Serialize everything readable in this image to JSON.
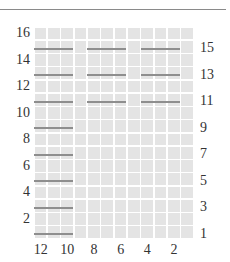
{
  "chart": {
    "title": "",
    "columns": 12,
    "rows": 16,
    "left_labels": [
      "16",
      "14",
      "12",
      "10",
      "8",
      "6",
      "4",
      "2"
    ],
    "right_labels": [
      "15",
      "13",
      "11",
      "9",
      "7",
      "5",
      "3",
      "1"
    ],
    "bottom_labels": [
      "12",
      "10",
      "8",
      "6",
      "4",
      "2"
    ],
    "colors": {
      "cell": "#e4e4e4",
      "gridline": "#ffffff",
      "stripe": "#8e8e8e",
      "label": "#333333"
    },
    "stripes": [
      {
        "row": 15,
        "segments": [
          [
            1,
            3
          ],
          [
            5,
            7
          ],
          [
            9,
            11
          ]
        ]
      },
      {
        "row": 13,
        "segments": [
          [
            1,
            3
          ],
          [
            5,
            7
          ],
          [
            9,
            11
          ]
        ]
      },
      {
        "row": 11,
        "segments": [
          [
            1,
            3
          ],
          [
            5,
            7
          ],
          [
            9,
            11
          ]
        ]
      },
      {
        "row": 9,
        "segments": [
          [
            1,
            3
          ]
        ]
      },
      {
        "row": 7,
        "segments": [
          [
            1,
            3
          ]
        ]
      },
      {
        "row": 5,
        "segments": [
          [
            1,
            3
          ]
        ]
      },
      {
        "row": 3,
        "segments": [
          [
            1,
            3
          ]
        ]
      },
      {
        "row": 1,
        "segments": [
          [
            1,
            3
          ]
        ]
      }
    ]
  }
}
